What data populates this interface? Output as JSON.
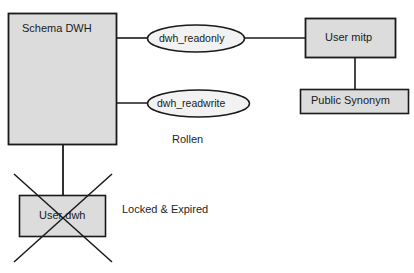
{
  "diagram": {
    "background_color": "#ffffff",
    "node_fill_color": "#dcdcdc",
    "ellipse_fill_color": "#f2f2f2",
    "stroke_color": "#1a1a1a",
    "text_color": "#1a1a1a",
    "nodes": {
      "schema_dwh": {
        "label": "Schema DWH",
        "shape": "rectangle"
      },
      "user_mitp": {
        "label": "User mitp",
        "shape": "rectangle"
      },
      "public_synonym": {
        "label": "Public Synonym",
        "shape": "rectangle"
      },
      "user_dwh": {
        "label": "User dwh",
        "shape": "rectangle",
        "crossed_out": true
      }
    },
    "roles": [
      {
        "label": "dwh_readonly",
        "shape": "ellipse"
      },
      {
        "label": "dwh_readwrite",
        "shape": "ellipse"
      }
    ],
    "annotations": {
      "roles_group": "Rollen",
      "user_dwh_status": "Locked & Expired"
    }
  }
}
